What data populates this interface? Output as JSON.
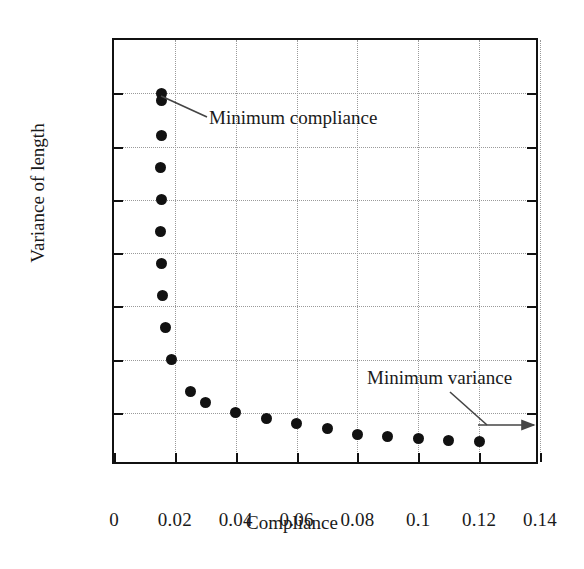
{
  "chart_data": {
    "type": "scatter",
    "title": "",
    "xlabel": "Compliance",
    "ylabel": "Variance of length",
    "xlim": [
      0,
      0.14
    ],
    "ylim": [
      25,
      65
    ],
    "xticks": [
      "0",
      "0.02",
      "0.04",
      "0.06",
      "0.08",
      "0.1",
      "0.12",
      "0.14"
    ],
    "xtick_values": [
      0,
      0.02,
      0.04,
      0.06,
      0.08,
      0.1,
      0.12,
      0.14
    ],
    "yticks": [
      "25",
      "30",
      "35",
      "40",
      "45",
      "50",
      "55",
      "60",
      "65"
    ],
    "ytick_values": [
      25,
      30,
      35,
      40,
      45,
      50,
      55,
      60,
      65
    ],
    "grid": true,
    "legend": false,
    "marker": "filled-circle",
    "marker_color": "#111111",
    "series": [
      {
        "name": "Pareto front",
        "x": [
          0.0155,
          0.0155,
          0.0155,
          0.0152,
          0.0155,
          0.0152,
          0.0155,
          0.016,
          0.0168,
          0.019,
          0.025,
          0.03,
          0.04,
          0.05,
          0.06,
          0.07,
          0.08,
          0.09,
          0.1,
          0.11,
          0.12
        ],
        "y": [
          60.0,
          59.3,
          56.0,
          53.0,
          50.0,
          47.0,
          44.0,
          41.0,
          38.0,
          35.0,
          32.0,
          31.0,
          30.0,
          29.5,
          29.0,
          28.5,
          28.0,
          27.8,
          27.6,
          27.4,
          27.3
        ]
      }
    ],
    "annotations": [
      {
        "label": "Minimum compliance",
        "text_x": 0.0319,
        "text_y": 58.0,
        "point_x": 0.016,
        "point_y": 59.6,
        "kind": "leader-line"
      },
      {
        "label": "Minimum variance",
        "text_x": 0.0838,
        "text_y": 35.6,
        "point_x": 0.137,
        "point_y": 27.4,
        "kind": "leader-arrow"
      }
    ]
  },
  "colors": {
    "frame": "#111111",
    "grid": "#9a9a9a",
    "marker": "#111111",
    "annotation": "#444444",
    "background": "#ffffff"
  }
}
